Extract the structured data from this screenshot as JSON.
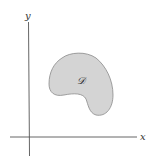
{
  "diagram": {
    "axes": {
      "x_label": "x",
      "y_label": "y",
      "color": "#555555"
    },
    "region": {
      "label": "𝒟",
      "fill": "#d4d4d4",
      "stroke": "#8a8a8a"
    }
  }
}
